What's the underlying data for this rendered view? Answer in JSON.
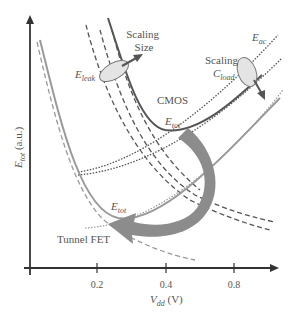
{
  "figure": {
    "type": "schematic energy vs supply voltage",
    "x_axis": {
      "label_main": "V",
      "label_sub": "dd",
      "label_unit": " (V)",
      "ticks": [
        "0.2",
        "0.4",
        "0.8"
      ]
    },
    "y_axis": {
      "label_main": "E",
      "label_sub": "tot",
      "label_unit": " (a.u.)"
    },
    "annotations": {
      "scaling_size_line1": "Scaling",
      "scaling_size_line2": "Size",
      "scaling_cload_line1": "Scaling",
      "cload_main": "C",
      "cload_sub": "load",
      "eleak_main": "E",
      "eleak_sub": "leak",
      "eac_main": "E",
      "eac_sub": "ac",
      "cmos": "CMOS",
      "etot_cmos_main": "E",
      "etot_cmos_sub": "tot",
      "etot_tfet_main": "E",
      "etot_tfet_sub": "tot",
      "tunnel_fet": "Tunnel FET"
    },
    "colors": {
      "cmos_curve": "#555555",
      "tfet_curve": "#9a9a9a",
      "arrow_fill": "#8c8c8c",
      "axis": "#333333"
    }
  }
}
